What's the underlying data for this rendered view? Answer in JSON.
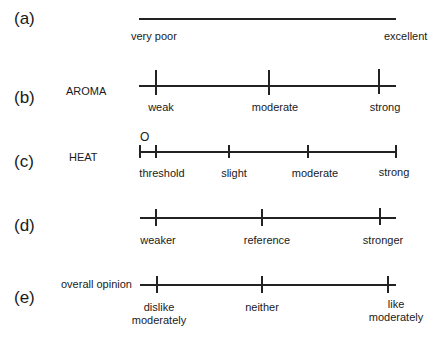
{
  "scales": [
    {
      "id": "a",
      "letter": "(a)",
      "name": "",
      "anchors": [
        {
          "label": "very poor",
          "x": 139,
          "tick": false
        },
        {
          "label": "excellent",
          "x": 396,
          "tick": false
        }
      ]
    },
    {
      "id": "b",
      "letter": "(b)",
      "name": "AROMA",
      "anchors": [
        {
          "label": "weak",
          "x": 156,
          "tick": true
        },
        {
          "label": "moderate",
          "x": 269,
          "tick": true
        },
        {
          "label": "strong",
          "x": 379,
          "tick": true
        }
      ]
    },
    {
      "id": "c",
      "letter": "(c)",
      "name": "HEAT",
      "zero_label": "O",
      "anchors": [
        {
          "label": "",
          "x": 140,
          "tick": true
        },
        {
          "label": "threshold",
          "x": 156,
          "tick": true
        },
        {
          "label": "slight",
          "x": 229,
          "tick": true
        },
        {
          "label": "moderate",
          "x": 308,
          "tick": true
        },
        {
          "label": "strong",
          "x": 396,
          "tick": true
        }
      ]
    },
    {
      "id": "d",
      "letter": "(d)",
      "name": "",
      "anchors": [
        {
          "label": "weaker",
          "x": 156,
          "tick": true
        },
        {
          "label": "reference",
          "x": 261,
          "tick": true
        },
        {
          "label": "stronger",
          "x": 380,
          "tick": true
        }
      ]
    },
    {
      "id": "e",
      "letter": "(e)",
      "name": "overall opinion",
      "anchors": [
        {
          "label": "dislike moderately",
          "line1": "dislike",
          "line2": "moderately",
          "x": 156,
          "tick": true
        },
        {
          "label": "neither",
          "x": 262,
          "tick": true
        },
        {
          "label": "like moderately",
          "line1": "like",
          "line2": "moderately",
          "x": 388,
          "tick": true
        }
      ]
    }
  ]
}
